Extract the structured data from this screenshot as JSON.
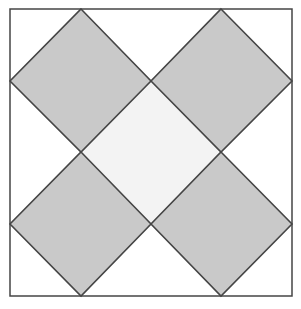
{
  "diagram": {
    "type": "geometric-pattern",
    "canvas": {
      "width": 301,
      "height": 309
    },
    "colors": {
      "background": "#ffffff",
      "outer_square_fill": "#ffffff",
      "center_fill": "#f3f3f3",
      "diamond_fill": "#c9c9c9",
      "stroke": "#454545"
    },
    "outer_square": {
      "x": 10,
      "y": 9,
      "width": 282,
      "height": 287
    },
    "center_diamond": {
      "points": "151,81 221,152 151,224 81,152"
    },
    "diamonds": [
      {
        "name": "top-left",
        "points": "81,9 151,81 81,152 10,81"
      },
      {
        "name": "top-right",
        "points": "221,9 292,81 221,152 151,81"
      },
      {
        "name": "bottom-left",
        "points": "81,152 151,224 81,296 10,224"
      },
      {
        "name": "bottom-right",
        "points": "221,152 292,224 221,296 151,224"
      }
    ]
  }
}
